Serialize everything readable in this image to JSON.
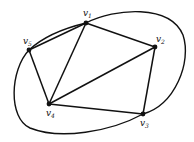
{
  "graph": {
    "vertices": [
      {
        "id": "v1",
        "name": "v",
        "sub": "1",
        "x": 86,
        "y": 23,
        "lx": 83,
        "ly": 16
      },
      {
        "id": "v2",
        "name": "v",
        "sub": "2",
        "x": 155,
        "y": 47,
        "lx": 156,
        "ly": 42
      },
      {
        "id": "v3",
        "name": "v",
        "sub": "3",
        "x": 143,
        "y": 114,
        "lx": 140,
        "ly": 126
      },
      {
        "id": "v4",
        "name": "v",
        "sub": "4",
        "x": 49,
        "y": 104,
        "lx": 46,
        "ly": 116
      },
      {
        "id": "v5",
        "name": "v",
        "sub": "5",
        "x": 29,
        "y": 50,
        "lx": 23,
        "ly": 44
      }
    ],
    "edges": [
      [
        "v1",
        "v2"
      ],
      [
        "v1",
        "v5"
      ],
      [
        "v1",
        "v4"
      ],
      [
        "v2",
        "v4"
      ],
      [
        "v2",
        "v3"
      ],
      [
        "v3",
        "v4"
      ],
      [
        "v4",
        "v5"
      ]
    ],
    "curved_edge": {
      "from": "v5",
      "to": "v3",
      "via": "outer-ellipse"
    },
    "colors": {
      "stroke": "#111111",
      "background": "#ffffff"
    }
  }
}
